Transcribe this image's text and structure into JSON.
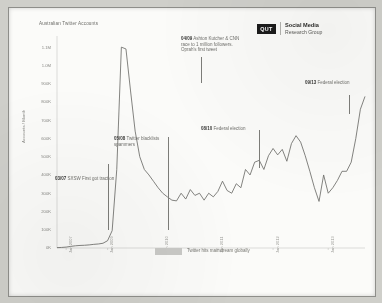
{
  "header": {
    "org_abbrev": "QUT",
    "org_line1": "Social Media",
    "org_line2": "Research Group"
  },
  "banner": {
    "label": "Twitter hits mainstream globally"
  },
  "annotations": [
    {
      "date": "03/07",
      "text": " SXSW",
      "body": "First got traction"
    },
    {
      "date": "05/08",
      "text": " Twitter",
      "body": "blacklists spammers"
    },
    {
      "date": "04/09",
      "text": " Ashton Kutcher",
      "body": "& CNN race to 1 million followers. Oprah's first tweet"
    },
    {
      "date": "08/10",
      "text": " Federal",
      "body": "election"
    },
    {
      "date": "09/13",
      "text": " Federal",
      "body": "election"
    }
  ],
  "chart_data": {
    "type": "line",
    "title": "Australian Twitter Accounts",
    "xlabel": "",
    "ylabel": "Accounts / Month",
    "ylim": [
      0,
      1150000
    ],
    "ytick_labels": [
      "1.1M",
      "1.0M",
      "900K",
      "800K",
      "700K",
      "600K",
      "500K",
      "400K",
      "300K",
      "200K",
      "100K",
      "0K"
    ],
    "ytick_values": [
      1100000,
      1000000,
      900000,
      800000,
      700000,
      600000,
      500000,
      400000,
      300000,
      200000,
      100000,
      0
    ],
    "xtick_labels": [
      "Jan 2007",
      "Jan 2008",
      "Jan 2009",
      "Jan 2010",
      "Jan 2011",
      "Jan 2012",
      "Jan 2013"
    ],
    "grid": false,
    "legend": "none",
    "x": [
      "2006-07",
      "2006-10",
      "2007-01",
      "2007-03",
      "2007-05",
      "2007-08",
      "2007-11",
      "2008-02",
      "2008-05",
      "2008-08",
      "2008-11",
      "2009-01",
      "2009-02",
      "2009-03",
      "2009-04",
      "2009-05",
      "2009-06",
      "2009-07",
      "2009-08",
      "2009-09",
      "2009-10",
      "2009-11",
      "2009-12",
      "2010-01",
      "2010-02",
      "2010-03",
      "2010-04",
      "2010-05",
      "2010-06",
      "2010-07",
      "2010-08",
      "2010-09",
      "2010-10",
      "2010-11",
      "2010-12",
      "2011-01",
      "2011-02",
      "2011-03",
      "2011-04",
      "2011-05",
      "2011-06",
      "2011-07",
      "2011-08",
      "2011-09",
      "2011-10",
      "2011-11",
      "2011-12",
      "2012-01",
      "2012-02",
      "2012-03",
      "2012-04",
      "2012-05",
      "2012-06",
      "2012-07",
      "2012-08",
      "2012-09",
      "2012-10",
      "2012-11",
      "2012-12",
      "2013-01",
      "2013-02",
      "2013-03",
      "2013-04",
      "2013-05",
      "2013-06",
      "2013-07",
      "2013-08",
      "2013-09"
    ],
    "values": [
      2000,
      3000,
      5000,
      9000,
      12000,
      14000,
      15000,
      17000,
      20000,
      22000,
      26000,
      40000,
      95000,
      430000,
      1100000,
      1090000,
      860000,
      640000,
      500000,
      430000,
      400000,
      365000,
      330000,
      300000,
      280000,
      262000,
      258000,
      300000,
      268000,
      320000,
      288000,
      300000,
      262000,
      300000,
      280000,
      310000,
      366000,
      315000,
      300000,
      352000,
      330000,
      430000,
      400000,
      470000,
      480000,
      430000,
      505000,
      545000,
      510000,
      540000,
      475000,
      572000,
      615000,
      580000,
      505000,
      420000,
      330000,
      255000,
      400000,
      300000,
      330000,
      370000,
      420000,
      420000,
      470000,
      600000,
      760000,
      830000
    ],
    "annotation_markers": [
      {
        "label": "03/07",
        "x_frac": 0.165,
        "y_top": 0.6,
        "y_bot": 0.915
      },
      {
        "label": "05/08",
        "x_frac": 0.362,
        "y_top": 0.47,
        "y_bot": 0.915
      },
      {
        "label": "04/09",
        "x_frac": 0.468,
        "y_top": 0.09,
        "y_bot": 0.215
      },
      {
        "label": "08/10",
        "x_frac": 0.655,
        "y_top": 0.44,
        "y_bot": 0.62
      },
      {
        "label": "09/13",
        "x_frac": 0.948,
        "y_top": 0.27,
        "y_bot": 0.36
      }
    ],
    "line_color": "#6e6e6a"
  }
}
